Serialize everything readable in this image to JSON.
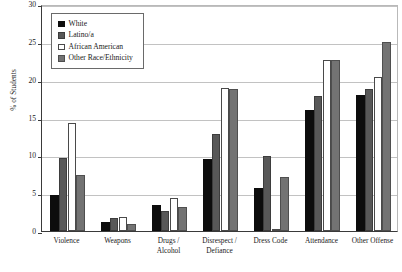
{
  "chart_data": {
    "type": "bar",
    "title": "",
    "xlabel": "",
    "ylabel": "% of Students",
    "ylim": [
      0,
      30
    ],
    "yticks": [
      0,
      5,
      10,
      15,
      20,
      25,
      30
    ],
    "grid": true,
    "legend_position": "top-left",
    "categories": [
      "Violence",
      "Weapons",
      "Drugs / Alcohol",
      "Disrespect / Defiance",
      "Dress Code",
      "Attendance",
      "Other Offense"
    ],
    "series": [
      {
        "name": "White",
        "color": "#0d0d0d",
        "values": [
          4.8,
          1.2,
          3.5,
          9.5,
          5.7,
          16.0,
          18.0
        ]
      },
      {
        "name": "Latino/a",
        "color": "#585858",
        "values": [
          9.6,
          1.7,
          2.6,
          12.8,
          9.9,
          17.9,
          18.8
        ]
      },
      {
        "name": "African American",
        "color": "#ffffff",
        "values": [
          14.3,
          1.9,
          4.3,
          18.9,
          0.2,
          22.6,
          20.4
        ]
      },
      {
        "name": "Other Race/Ethnicity",
        "color": "#737373",
        "values": [
          7.4,
          0.9,
          3.2,
          18.8,
          7.2,
          22.6,
          25.0
        ]
      }
    ]
  },
  "axis": {
    "y_title": "% of Students",
    "y_tick_labels": [
      "0",
      "5",
      "10",
      "15",
      "20",
      "25",
      "30"
    ],
    "x_tick_labels": [
      "Violence",
      "Weapons",
      "Drugs /\nAlcohol",
      "Disrespect /\nDefiance",
      "Dress Code",
      "Attendance",
      "Other Offense"
    ]
  },
  "legend": {
    "items": [
      {
        "label": "White",
        "swatch": "legend-swatch-white"
      },
      {
        "label": "Latino/a",
        "swatch": "legend-swatch-latino"
      },
      {
        "label": "African American",
        "swatch": "legend-swatch-african-american"
      },
      {
        "label": "Other Race/Ethnicity",
        "swatch": "legend-swatch-other-race"
      }
    ]
  }
}
